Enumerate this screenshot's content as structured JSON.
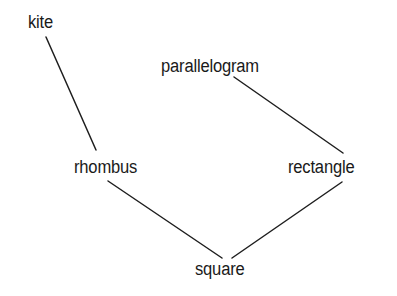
{
  "diagram": {
    "type": "hierarchy",
    "title": "",
    "nodes": [
      {
        "id": "kite",
        "label": "kite"
      },
      {
        "id": "parallelogram",
        "label": "parallelogram"
      },
      {
        "id": "rhombus",
        "label": "rhombus"
      },
      {
        "id": "rectangle",
        "label": "rectangle"
      },
      {
        "id": "square",
        "label": "square"
      }
    ],
    "edges": [
      {
        "from": "kite",
        "to": "rhombus"
      },
      {
        "from": "parallelogram",
        "to": "rectangle"
      },
      {
        "from": "rhombus",
        "to": "square"
      },
      {
        "from": "rectangle",
        "to": "square"
      }
    ],
    "colors": {
      "line": "#1e1e1e",
      "text": "#1a1a1a",
      "background": "#ffffff"
    }
  }
}
